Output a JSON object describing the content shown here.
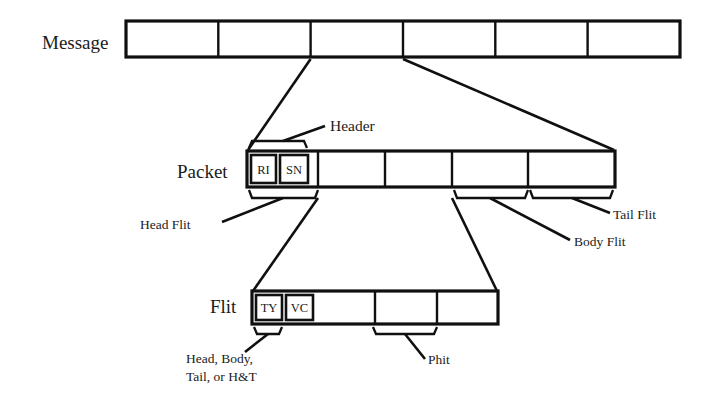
{
  "diagram": {
    "colors": {
      "stroke": "#101010",
      "background": "#ffffff",
      "text": "#1b1b1b"
    },
    "rows": [
      {
        "id": "message",
        "label": "Message",
        "cell_count": 6,
        "cells": [
          "",
          "",
          "",
          "",
          "",
          ""
        ]
      },
      {
        "id": "packet",
        "label": "Packet",
        "cell_count": 6,
        "cells": [
          "RI",
          "SN",
          "",
          "",
          "",
          ""
        ]
      },
      {
        "id": "flit",
        "label": "Flit",
        "cell_count": 5,
        "cells": [
          "TY",
          "VC",
          "",
          "",
          ""
        ]
      }
    ],
    "callouts": [
      {
        "id": "header",
        "label": "Header"
      },
      {
        "id": "head-flit",
        "label": "Head Flit"
      },
      {
        "id": "body-flit",
        "label": "Body Flit"
      },
      {
        "id": "tail-flit",
        "label": "Tail Flit"
      },
      {
        "id": "flit-type",
        "label_line1": "Head, Body,",
        "label_line2": "Tail, or H&T"
      },
      {
        "id": "phit",
        "label": "Phit"
      }
    ]
  }
}
